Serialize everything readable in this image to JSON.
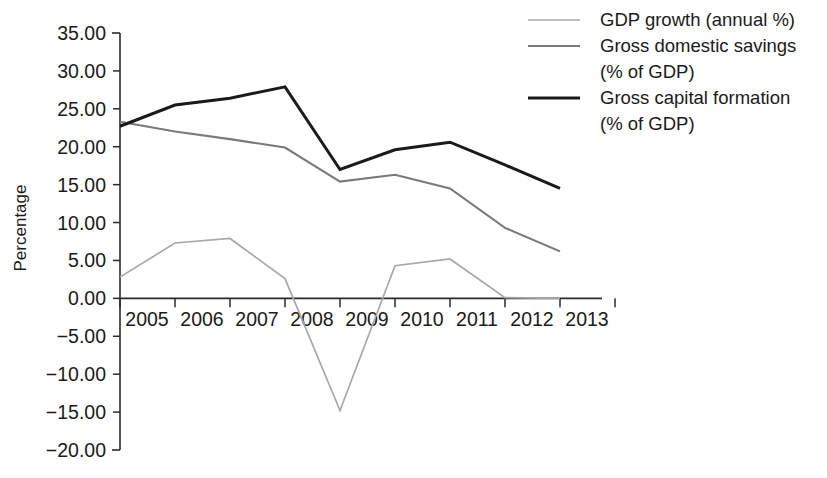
{
  "chart_data": {
    "type": "line",
    "title": "",
    "xlabel": "",
    "ylabel": "Percentage",
    "categories": [
      "2005",
      "2006",
      "2007",
      "2008",
      "2009",
      "2010",
      "2011",
      "2012",
      "2013"
    ],
    "ylim": [
      -20,
      35
    ],
    "ytick_labels": [
      "35.00",
      "30.00",
      "25.00",
      "20.00",
      "15.00",
      "10.00",
      "5.00",
      "0.00",
      "−5.00",
      "−10.00",
      "−15.00",
      "−20.00"
    ],
    "ytick_values": [
      35,
      30,
      25,
      20,
      15,
      10,
      5,
      0,
      -5,
      -10,
      -15,
      -20
    ],
    "ytick_step": 5,
    "grid": false,
    "legend_position": "top-right",
    "series": [
      {
        "name": "GDP growth (annual %)",
        "color": "#a8a8a8",
        "stroke_width": 1.7,
        "values": [
          2.8,
          7.3,
          7.9,
          2.6,
          -14.8,
          4.3,
          5.2,
          0.1,
          0.0
        ]
      },
      {
        "name": "Gross domestic savings (% of GDP)",
        "color": "#7a7a7a",
        "stroke_width": 2.1,
        "values": [
          23.3,
          22.0,
          21.0,
          19.9,
          15.4,
          16.3,
          14.5,
          9.3,
          6.2
        ]
      },
      {
        "name": "Gross capital formation (% of GDP)",
        "color": "#1a1a1a",
        "stroke_width": 3.0,
        "values": [
          22.7,
          25.5,
          26.4,
          27.9,
          17.0,
          19.6,
          20.6,
          17.6,
          14.5
        ]
      }
    ]
  },
  "legend": {
    "entries": [
      {
        "line1": "GDP growth (annual %)",
        "line2": "",
        "swatch_color": "#a8a8a8",
        "swatch_width": 1.7
      },
      {
        "line1": "Gross domestic savings",
        "line2": "(% of GDP)",
        "swatch_color": "#7a7a7a",
        "swatch_width": 2.1
      },
      {
        "line1": "Gross capital formation",
        "line2": "(% of GDP)",
        "swatch_color": "#1a1a1a",
        "swatch_width": 3.0
      }
    ]
  },
  "axes": {
    "y_axis_title": "Percentage"
  }
}
